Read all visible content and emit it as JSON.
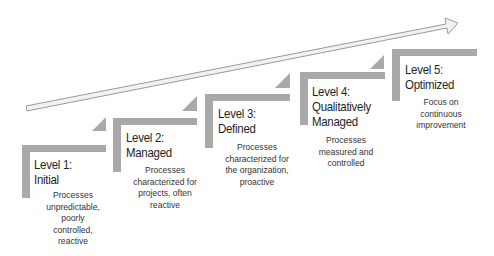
{
  "diagram": {
    "type": "maturity-staircase",
    "colors": {
      "frame": "#a9a9a9",
      "arrow_fill": "#f2f2f2",
      "arrow_stroke": "#9a9a9a",
      "text": "#1f1f1f"
    },
    "levels": [
      {
        "title_line1": "Level 1:",
        "title_line2": "Initial",
        "title_line3": "",
        "desc": [
          "Processes",
          "unpredictable,",
          "poorly",
          "controlled,",
          "reactive"
        ]
      },
      {
        "title_line1": "Level 2:",
        "title_line2": "Managed",
        "title_line3": "",
        "desc": [
          "Processes",
          "characterized for",
          "projects, often",
          "reactive"
        ]
      },
      {
        "title_line1": "Level 3:",
        "title_line2": "Defined",
        "title_line3": "",
        "desc": [
          "Processes",
          "characterized for",
          "the organization,",
          "proactive"
        ]
      },
      {
        "title_line1": "Level 4:",
        "title_line2": "Qualitatively",
        "title_line3": "Managed",
        "desc": [
          "Processes",
          "measured and",
          "controlled"
        ]
      },
      {
        "title_line1": "Level 5:",
        "title_line2": "Optimized",
        "title_line3": "",
        "desc": [
          "Focus on",
          "continuous",
          "improvement"
        ]
      }
    ]
  }
}
